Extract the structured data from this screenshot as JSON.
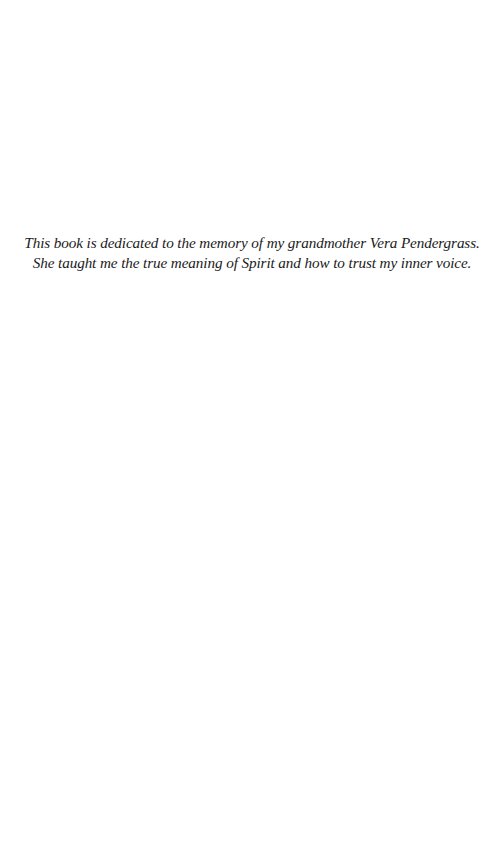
{
  "page": {
    "background": "#ffffff",
    "text_color": "#1a1a1a"
  },
  "dedication": {
    "lines": [
      "This book is dedicated to the memory of my grandmother Vera Pendergrass.",
      "She taught me the true meaning of Spirit and how to trust my inner voice."
    ]
  }
}
